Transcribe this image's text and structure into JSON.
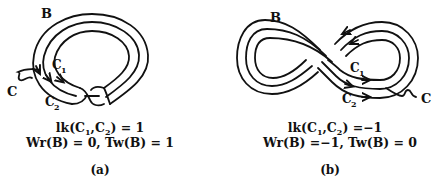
{
  "panel_a": {
    "labels": {
      "band": "B",
      "core": "C",
      "c1": "C",
      "c1_sub": "1",
      "c2": "C",
      "c2_sub": "2"
    },
    "linking": {
      "prefix": "lk(C",
      "sub1": "1",
      "mid": ",C",
      "sub2": "2",
      "suffix": ") = 1"
    },
    "writhe_twist": "Wr(B) = 0, Tw(B) = 1",
    "caption": "(a)"
  },
  "panel_b": {
    "labels": {
      "band": "B",
      "core": "C",
      "c1": "C",
      "c1_sub": "1",
      "c2": "C",
      "c2_sub": "2"
    },
    "linking": {
      "prefix": "lk(C",
      "sub1": "1",
      "mid": ",C",
      "sub2": "2",
      "suffix": ") =−1"
    },
    "writhe_twist": "Wr(B) =−1, Tw(B) = 0",
    "caption": "(b)"
  }
}
